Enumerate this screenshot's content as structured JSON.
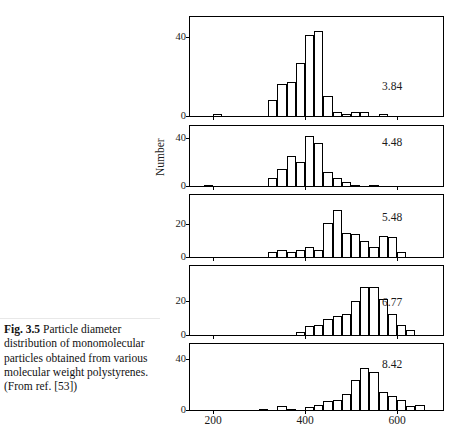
{
  "caption": {
    "label": "Fig. 3.5",
    "text": "  Particle diameter distribution of monomolecular particles obtained from various molecular weight polystyrenes. (From ref. [53])"
  },
  "chart_data": {
    "type": "bar",
    "title": "",
    "header_annotation": "Mw × 10",
    "header_annotation_exponent": "−6",
    "ylabel": "Number",
    "xlabel": "",
    "xlim": [
      150,
      700
    ],
    "xticks": [
      200,
      400,
      600
    ],
    "xtick_labels": [
      "200",
      "400",
      "600"
    ],
    "bin_width": 20,
    "panels": [
      {
        "label": "3.84",
        "ylim": [
          0,
          50
        ],
        "yticks": [
          0,
          40
        ],
        "ytick_labels": [
          "0",
          "40"
        ],
        "bins": [
          {
            "x": 210,
            "value": 1
          },
          {
            "x": 330,
            "value": 8
          },
          {
            "x": 350,
            "value": 16
          },
          {
            "x": 370,
            "value": 17
          },
          {
            "x": 390,
            "value": 27
          },
          {
            "x": 410,
            "value": 41
          },
          {
            "x": 430,
            "value": 43
          },
          {
            "x": 450,
            "value": 10
          },
          {
            "x": 470,
            "value": 2
          },
          {
            "x": 490,
            "value": 1
          },
          {
            "x": 510,
            "value": 2
          },
          {
            "x": 530,
            "value": 2
          },
          {
            "x": 570,
            "value": 1
          }
        ]
      },
      {
        "label": "4.48",
        "ylim": [
          0,
          50
        ],
        "yticks": [
          0,
          40
        ],
        "ytick_labels": [
          "0",
          "40"
        ],
        "bins": [
          {
            "x": 190,
            "value": 1
          },
          {
            "x": 330,
            "value": 7
          },
          {
            "x": 350,
            "value": 14
          },
          {
            "x": 370,
            "value": 25
          },
          {
            "x": 390,
            "value": 20
          },
          {
            "x": 410,
            "value": 42
          },
          {
            "x": 430,
            "value": 36
          },
          {
            "x": 450,
            "value": 12
          },
          {
            "x": 470,
            "value": 7
          },
          {
            "x": 490,
            "value": 3
          },
          {
            "x": 510,
            "value": 1
          },
          {
            "x": 550,
            "value": 1
          }
        ]
      },
      {
        "label": "5.48",
        "ylim": [
          0,
          38
        ],
        "yticks": [
          0,
          20
        ],
        "ytick_labels": [
          "0",
          "20"
        ],
        "bins": [
          {
            "x": 330,
            "value": 3
          },
          {
            "x": 350,
            "value": 4
          },
          {
            "x": 370,
            "value": 3
          },
          {
            "x": 390,
            "value": 4
          },
          {
            "x": 410,
            "value": 6
          },
          {
            "x": 430,
            "value": 4
          },
          {
            "x": 450,
            "value": 21
          },
          {
            "x": 470,
            "value": 29
          },
          {
            "x": 490,
            "value": 15
          },
          {
            "x": 510,
            "value": 14
          },
          {
            "x": 530,
            "value": 10
          },
          {
            "x": 550,
            "value": 6
          },
          {
            "x": 570,
            "value": 13
          },
          {
            "x": 590,
            "value": 12
          },
          {
            "x": 610,
            "value": 3
          }
        ]
      },
      {
        "label": "6.77",
        "ylim": [
          0,
          40
        ],
        "yticks": [
          0,
          20
        ],
        "ytick_labels": [
          "0",
          "20"
        ],
        "bins": [
          {
            "x": 390,
            "value": 2
          },
          {
            "x": 410,
            "value": 5
          },
          {
            "x": 430,
            "value": 6
          },
          {
            "x": 450,
            "value": 9
          },
          {
            "x": 470,
            "value": 11
          },
          {
            "x": 490,
            "value": 12
          },
          {
            "x": 510,
            "value": 20
          },
          {
            "x": 530,
            "value": 28
          },
          {
            "x": 550,
            "value": 28
          },
          {
            "x": 570,
            "value": 21
          },
          {
            "x": 590,
            "value": 12
          },
          {
            "x": 610,
            "value": 6
          },
          {
            "x": 630,
            "value": 3
          }
        ]
      },
      {
        "label": "8.42",
        "ylim": [
          0,
          52
        ],
        "yticks": [
          0,
          40
        ],
        "ytick_labels": [
          "0",
          "40"
        ],
        "bins": [
          {
            "x": 310,
            "value": 1
          },
          {
            "x": 350,
            "value": 3
          },
          {
            "x": 370,
            "value": 1
          },
          {
            "x": 410,
            "value": 2
          },
          {
            "x": 430,
            "value": 4
          },
          {
            "x": 450,
            "value": 7
          },
          {
            "x": 470,
            "value": 8
          },
          {
            "x": 490,
            "value": 13
          },
          {
            "x": 510,
            "value": 24
          },
          {
            "x": 530,
            "value": 33
          },
          {
            "x": 550,
            "value": 30
          },
          {
            "x": 570,
            "value": 14
          },
          {
            "x": 590,
            "value": 11
          },
          {
            "x": 610,
            "value": 8
          },
          {
            "x": 630,
            "value": 3
          },
          {
            "x": 650,
            "value": 4
          }
        ]
      }
    ]
  },
  "colors": {
    "ink": "#000000",
    "background": "#ffffff",
    "rule": "#e8e8e8"
  }
}
